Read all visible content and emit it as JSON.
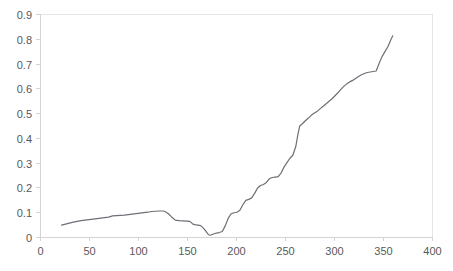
{
  "chart_data": {
    "type": "line",
    "title": "",
    "subtitle": "",
    "xlabel": "",
    "ylabel": "",
    "xlim": [
      0,
      400
    ],
    "ylim": [
      0,
      0.9
    ],
    "grid": false,
    "legend": null,
    "x_ticks": [
      0,
      50,
      100,
      150,
      200,
      250,
      300,
      350,
      400
    ],
    "x_tick_labels": [
      "0",
      "50",
      "100",
      "150",
      "200",
      "250",
      "300",
      "350",
      "400"
    ],
    "y_ticks": [
      0,
      0.1,
      0.2,
      0.3,
      0.4,
      0.5,
      0.6,
      0.7,
      0.8,
      0.9
    ],
    "y_tick_labels": [
      "0",
      "0.1",
      "0.2",
      "0.3",
      "0.4",
      "0.5",
      "0.6",
      "0.7",
      "0.8",
      "0.9"
    ],
    "series": [
      {
        "name": "series-1",
        "color": "#6e6e76",
        "x": [
          22,
          26,
          30,
          34,
          38,
          42,
          46,
          50,
          54,
          58,
          62,
          66,
          70,
          74,
          78,
          82,
          86,
          90,
          94,
          98,
          102,
          106,
          110,
          114,
          118,
          122,
          126,
          128,
          131,
          134,
          138,
          142,
          146,
          150,
          153,
          156,
          158,
          161,
          164,
          167,
          170,
          172,
          174,
          177,
          180,
          183,
          186,
          189,
          192,
          195,
          198,
          201,
          204,
          207,
          210,
          213,
          216,
          219,
          222,
          225,
          228,
          231,
          234,
          237,
          240,
          243,
          246,
          249,
          252,
          255,
          258,
          261,
          263,
          265,
          268,
          271,
          274,
          277,
          280,
          283,
          286,
          289,
          292,
          295,
          298,
          301,
          304,
          307,
          310,
          313,
          316,
          319,
          322,
          325,
          328,
          331,
          334,
          337,
          340,
          343,
          346,
          349,
          352,
          355,
          358,
          360
        ],
        "y": [
          0.048,
          0.052,
          0.056,
          0.06,
          0.063,
          0.066,
          0.068,
          0.07,
          0.072,
          0.074,
          0.076,
          0.078,
          0.08,
          0.085,
          0.086,
          0.087,
          0.088,
          0.09,
          0.092,
          0.094,
          0.096,
          0.098,
          0.1,
          0.103,
          0.104,
          0.105,
          0.105,
          0.102,
          0.094,
          0.082,
          0.068,
          0.066,
          0.065,
          0.064,
          0.063,
          0.052,
          0.05,
          0.048,
          0.046,
          0.035,
          0.02,
          0.009,
          0.007,
          0.012,
          0.016,
          0.018,
          0.022,
          0.045,
          0.075,
          0.094,
          0.098,
          0.1,
          0.108,
          0.13,
          0.148,
          0.152,
          0.158,
          0.176,
          0.198,
          0.208,
          0.212,
          0.22,
          0.235,
          0.24,
          0.242,
          0.244,
          0.258,
          0.282,
          0.3,
          0.318,
          0.33,
          0.365,
          0.41,
          0.448,
          0.458,
          0.47,
          0.48,
          0.492,
          0.5,
          0.508,
          0.518,
          0.528,
          0.538,
          0.548,
          0.558,
          0.57,
          0.582,
          0.596,
          0.608,
          0.618,
          0.626,
          0.632,
          0.64,
          0.648,
          0.655,
          0.66,
          0.664,
          0.666,
          0.668,
          0.67,
          0.7,
          0.728,
          0.748,
          0.768,
          0.796,
          0.812
        ]
      }
    ]
  },
  "axes": {
    "plot_left_px": 40,
    "plot_right_px": 432,
    "plot_top_px": 14,
    "plot_bottom_px": 237
  },
  "colors": {
    "axis": "#d4d4d4",
    "frame": "#e6e6e6",
    "tick_text": "#58595b",
    "line": "#6e6e76",
    "background": "#ffffff"
  }
}
